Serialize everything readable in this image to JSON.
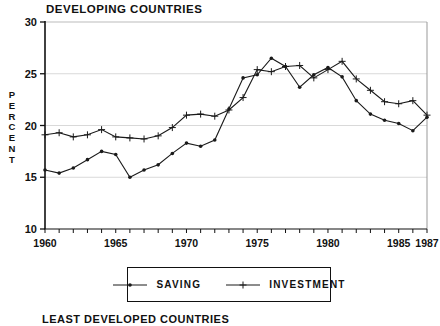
{
  "page": {
    "footer_title": "LEAST DEVELOPED COUNTRIES"
  },
  "chart_data": {
    "type": "line",
    "title": "DEVELOPING COUNTRIES",
    "ylabel": "PERCENT",
    "xlabel": "",
    "ylim": [
      10,
      30
    ],
    "xlim": [
      1960,
      1987
    ],
    "y_ticks": [
      30,
      25,
      20,
      15,
      10
    ],
    "x_ticks": [
      1960,
      1965,
      1970,
      1975,
      1980,
      1985,
      1987
    ],
    "grid": "light-horizontal-at-15-20-25",
    "legend_position": "bottom-center-boxed",
    "x": [
      1960,
      1961,
      1962,
      1963,
      1964,
      1965,
      1966,
      1967,
      1968,
      1969,
      1970,
      1971,
      1972,
      1973,
      1974,
      1975,
      1976,
      1977,
      1978,
      1979,
      1980,
      1981,
      1982,
      1983,
      1984,
      1985,
      1986,
      1987
    ],
    "series": [
      {
        "name": "SAVING",
        "marker": "dot",
        "color": "#1a1a1a",
        "values": [
          15.7,
          15.4,
          15.9,
          16.7,
          17.5,
          17.2,
          15.0,
          15.7,
          16.2,
          17.3,
          18.3,
          18.0,
          18.6,
          21.6,
          24.6,
          24.9,
          26.5,
          25.7,
          23.7,
          24.9,
          25.6,
          24.7,
          22.4,
          21.1,
          20.5,
          20.2,
          19.5,
          20.8
        ]
      },
      {
        "name": "INVESTMENT",
        "marker": "plus",
        "color": "#1a1a1a",
        "values": [
          19.1,
          19.3,
          18.9,
          19.1,
          19.6,
          18.9,
          18.8,
          18.7,
          19.0,
          19.8,
          21.0,
          21.1,
          20.9,
          21.5,
          22.7,
          25.4,
          25.2,
          25.7,
          25.8,
          24.6,
          25.4,
          26.2,
          24.5,
          23.4,
          22.3,
          22.1,
          22.4,
          21.0
        ]
      }
    ],
    "colors": {
      "axis": "#111111",
      "frame_light": "#bbbbbb",
      "frame_right": "#999999",
      "gridline": "#d9d9d9",
      "line": "#1a1a1a"
    }
  }
}
